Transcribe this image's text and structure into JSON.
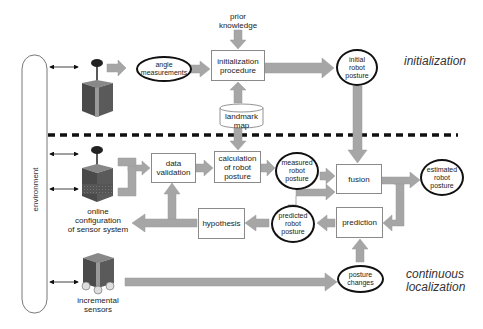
{
  "diagram": {
    "environment": {
      "label": "environment"
    },
    "phases": {
      "initialization": "initialization",
      "continuous": "continuous\nlocalization",
      "continuous_line1": "continuous",
      "continuous_line2": "localization"
    },
    "nodes": {
      "prior_knowledge": {
        "line1": "prior",
        "line2": "knowledge",
        "shape": "text"
      },
      "angle_measurements": {
        "line1": "angle",
        "line2": "measurements",
        "shape": "ellipse"
      },
      "initialization_procedure": {
        "line1": "initialization",
        "line2": "procedure",
        "shape": "box"
      },
      "initial_robot_posture": {
        "line1": "initial",
        "line2": "robot",
        "line3": "posture",
        "shape": "ellipse"
      },
      "landmark_map": {
        "line1": "landmark",
        "line2": "map",
        "shape": "cylinder"
      },
      "data_validation": {
        "line1": "data",
        "line2": "validation",
        "shape": "box"
      },
      "calculation_of_robot_posture": {
        "line1": "calculation",
        "line2": "of robot",
        "line3": "posture",
        "shape": "box"
      },
      "measured_robot_posture": {
        "line1": "measured",
        "line2": "robot",
        "line3": "posture",
        "shape": "ellipse"
      },
      "fusion": {
        "label": "fusion",
        "shape": "box"
      },
      "estimated_robot_posture": {
        "line1": "estimated",
        "line2": "robot",
        "line3": "posture",
        "shape": "ellipse"
      },
      "hypothesis": {
        "label": "hypothesis",
        "shape": "box"
      },
      "predicted_robot_posture": {
        "line1": "predicted",
        "line2": "robot",
        "line3": "posture",
        "shape": "ellipse"
      },
      "prediction": {
        "label": "prediction",
        "shape": "box"
      },
      "posture_changes": {
        "line1": "posture",
        "line2": "changes",
        "shape": "ellipse"
      },
      "online_config": {
        "line1": "online",
        "line2": "configuration",
        "line3": "of sensor system"
      },
      "incremental_sensors": {
        "line1": "incremental",
        "line2": "sensors"
      }
    },
    "edges": [
      [
        "environment",
        "angle_sensor_robot",
        "bidirectional"
      ],
      [
        "angle_sensor_robot",
        "angle_measurements"
      ],
      [
        "angle_measurements",
        "initialization_procedure"
      ],
      [
        "prior_knowledge",
        "initialization_procedure"
      ],
      [
        "landmark_map",
        "initialization_procedure"
      ],
      [
        "initialization_procedure",
        "initial_robot_posture"
      ],
      [
        "initial_robot_posture",
        "fusion"
      ],
      [
        "landmark_map",
        "calculation_of_robot_posture"
      ],
      [
        "environment",
        "online_sensor_robot",
        "bidirectional"
      ],
      [
        "online_sensor_robot",
        "data_validation"
      ],
      [
        "data_validation",
        "calculation_of_robot_posture"
      ],
      [
        "calculation_of_robot_posture",
        "measured_robot_posture"
      ],
      [
        "measured_robot_posture",
        "fusion"
      ],
      [
        "predicted_robot_posture",
        "fusion"
      ],
      [
        "fusion",
        "estimated_robot_posture"
      ],
      [
        "fusion",
        "prediction"
      ],
      [
        "prediction",
        "predicted_robot_posture"
      ],
      [
        "predicted_robot_posture",
        "hypothesis"
      ],
      [
        "hypothesis",
        "data_validation"
      ],
      [
        "hypothesis",
        "online_sensor_robot"
      ],
      [
        "environment",
        "incremental_sensor_robot",
        "bidirectional"
      ],
      [
        "incremental_sensor_robot",
        "posture_changes"
      ],
      [
        "posture_changes",
        "prediction"
      ]
    ],
    "colors": {
      "arrow_fill": "#a6a6a6",
      "ellipse_border": "#111111",
      "box_border": "#8a8a8a",
      "dashed_separator": "#111111"
    }
  }
}
